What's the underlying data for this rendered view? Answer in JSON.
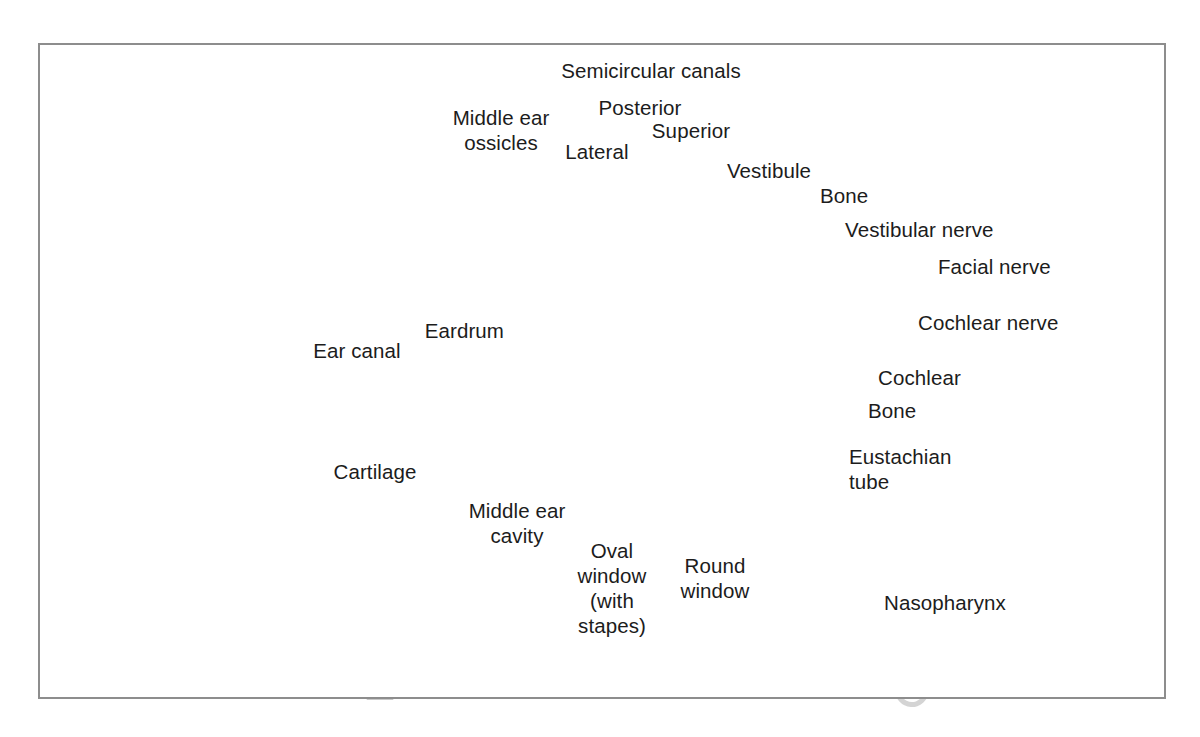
{
  "figure": {
    "kind": "anatomical-diagram",
    "frame_color": "#8d8d8d",
    "background_color": "#ffffff",
    "ink_color": "#1c1c1c"
  },
  "palette": {
    "outline": "#2a2a2a",
    "thin_outline": "#6a6a6a",
    "cartilage_grey": "#c9c9c9",
    "tissue_light": "#f2f2f2",
    "bone_grey": "#a8a8a8",
    "labyrinth_grey": "#9a9a9a",
    "cochlea_grey": "#a0a0a0",
    "dark_cavity": "#2e2e2e",
    "eustachian_dark": "#3a3a3a",
    "nasopharynx_grey": "#b5b5b5",
    "nerve_grey": "#cfcfcf"
  },
  "bracket": {
    "label": "Semicircular canals",
    "x_start": 568,
    "x_end": 733,
    "y": 86
  },
  "labels": [
    {
      "id": "semicircular-canals",
      "text": "Semicircular canals",
      "x": 651,
      "y": 58,
      "align": "center"
    },
    {
      "id": "posterior",
      "text": "Posterior",
      "x": 640,
      "y": 95,
      "align": "center"
    },
    {
      "id": "superior",
      "text": "Superior",
      "x": 691,
      "y": 118,
      "align": "center"
    },
    {
      "id": "lateral",
      "text": "Lateral",
      "x": 597,
      "y": 139,
      "align": "center"
    },
    {
      "id": "middle-ear-ossicles-1",
      "text": "Middle ear",
      "x": 501,
      "y": 105,
      "align": "center"
    },
    {
      "id": "middle-ear-ossicles-2",
      "text": "ossicles",
      "x": 501,
      "y": 130,
      "align": "center"
    },
    {
      "id": "vestibule",
      "text": "Vestibule",
      "x": 769,
      "y": 158,
      "align": "center"
    },
    {
      "id": "bone-upper",
      "text": "Bone",
      "x": 820,
      "y": 183,
      "align": "left"
    },
    {
      "id": "vestibular-nerve",
      "text": "Vestibular nerve",
      "x": 845,
      "y": 217,
      "align": "left"
    },
    {
      "id": "facial-nerve",
      "text": "Facial nerve",
      "x": 938,
      "y": 254,
      "align": "left"
    },
    {
      "id": "cochlear-nerve",
      "text": "Cochlear nerve",
      "x": 918,
      "y": 310,
      "align": "left"
    },
    {
      "id": "cochlear",
      "text": "Cochlear",
      "x": 878,
      "y": 365,
      "align": "left"
    },
    {
      "id": "bone-lower",
      "text": "Bone",
      "x": 868,
      "y": 398,
      "align": "left"
    },
    {
      "id": "eustachian-tube-1",
      "text": "Eustachian",
      "x": 849,
      "y": 444,
      "align": "left"
    },
    {
      "id": "eustachian-tube-2",
      "text": "tube",
      "x": 849,
      "y": 469,
      "align": "left"
    },
    {
      "id": "nasopharynx",
      "text": "Nasopharynx",
      "x": 884,
      "y": 590,
      "align": "left"
    },
    {
      "id": "eardrum",
      "text": "Eardrum",
      "x": 504,
      "y": 318,
      "align": "right"
    },
    {
      "id": "ear-canal",
      "text": "Ear canal",
      "x": 357,
      "y": 338,
      "align": "center"
    },
    {
      "id": "cartilage",
      "text": "Cartilage",
      "x": 375,
      "y": 459,
      "align": "center"
    },
    {
      "id": "middle-ear-cavity-1",
      "text": "Middle ear",
      "x": 517,
      "y": 498,
      "align": "center"
    },
    {
      "id": "middle-ear-cavity-2",
      "text": "cavity",
      "x": 517,
      "y": 523,
      "align": "center"
    },
    {
      "id": "oval-window-1",
      "text": "Oval",
      "x": 612,
      "y": 538,
      "align": "center"
    },
    {
      "id": "oval-window-2",
      "text": "window",
      "x": 612,
      "y": 563,
      "align": "center"
    },
    {
      "id": "oval-window-3",
      "text": "(with",
      "x": 612,
      "y": 588,
      "align": "center"
    },
    {
      "id": "oval-window-4",
      "text": "stapes)",
      "x": 612,
      "y": 613,
      "align": "center"
    },
    {
      "id": "round-window-1",
      "text": "Round",
      "x": 715,
      "y": 553,
      "align": "center"
    },
    {
      "id": "round-window-2",
      "text": "window",
      "x": 715,
      "y": 578,
      "align": "center"
    }
  ]
}
